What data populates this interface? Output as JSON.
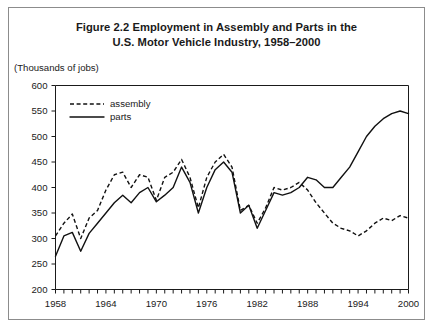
{
  "figure": {
    "title_line1": "Figure 2.2 Employment in Assembly and Parts in the",
    "title_line2": "U.S. Motor Vehicle Industry, 1958–2000",
    "units_label": "(Thousands of jobs)"
  },
  "legend": {
    "assembly_label": "assembly",
    "parts_label": "parts"
  },
  "chart_data": {
    "type": "line",
    "title": "Figure 2.2 Employment in Assembly and Parts in the U.S. Motor Vehicle Industry, 1958–2000",
    "xlabel": "",
    "ylabel": "(Thousands of jobs)",
    "ylim": [
      200,
      600
    ],
    "xlim": [
      1958,
      2000
    ],
    "ytick_labels": [
      "200",
      "250",
      "300",
      "350",
      "400",
      "450",
      "500",
      "550",
      "600"
    ],
    "ytick_values": [
      200,
      250,
      300,
      350,
      400,
      450,
      500,
      550,
      600
    ],
    "xtick_labels": [
      "1958",
      "1964",
      "1970",
      "1976",
      "1982",
      "1988",
      "1994",
      "2000"
    ],
    "xtick_values": [
      1958,
      1964,
      1970,
      1976,
      1982,
      1988,
      1994,
      2000
    ],
    "minor_xticks_every": 1,
    "grid": false,
    "legend_position": "top-left",
    "x": [
      1958,
      1959,
      1960,
      1961,
      1962,
      1963,
      1964,
      1965,
      1966,
      1967,
      1968,
      1969,
      1970,
      1971,
      1972,
      1973,
      1974,
      1975,
      1976,
      1977,
      1978,
      1979,
      1980,
      1981,
      1982,
      1983,
      1984,
      1985,
      1986,
      1987,
      1988,
      1989,
      1990,
      1991,
      1992,
      1993,
      1994,
      1995,
      1996,
      1997,
      1998,
      1999,
      2000
    ],
    "series": [
      {
        "name": "assembly",
        "style": "dashed",
        "values": [
          305,
          330,
          348,
          300,
          340,
          355,
          395,
          425,
          430,
          400,
          425,
          420,
          375,
          420,
          430,
          455,
          420,
          360,
          420,
          450,
          465,
          440,
          355,
          365,
          330,
          360,
          400,
          395,
          400,
          410,
          395,
          370,
          350,
          330,
          320,
          315,
          305,
          315,
          330,
          340,
          335,
          345,
          340
        ]
      },
      {
        "name": "parts",
        "style": "solid",
        "values": [
          265,
          305,
          312,
          275,
          310,
          330,
          350,
          370,
          385,
          370,
          390,
          400,
          372,
          385,
          400,
          440,
          410,
          350,
          400,
          435,
          450,
          430,
          350,
          365,
          320,
          355,
          390,
          385,
          390,
          400,
          420,
          415,
          400,
          400,
          420,
          440,
          470,
          500,
          520,
          535,
          545,
          550,
          545
        ]
      }
    ]
  }
}
